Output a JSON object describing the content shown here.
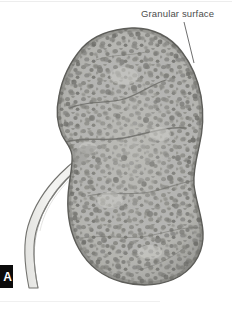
{
  "figure": {
    "panel_marker": "A",
    "background_color": "#ffffff"
  },
  "annotations": [
    {
      "id": "granular-surface",
      "label": "Granular surface",
      "text_x": 141,
      "text_y": 8,
      "leader_from": [
        184,
        22
      ],
      "leader_to": [
        194,
        63
      ],
      "leader_color": "#6e6e6e"
    }
  ],
  "anatomy": {
    "kidney": {
      "name": "kidney",
      "fill_color": "#b4b4b0",
      "outline_color": "#6a6a66",
      "speckle_colors": [
        "#8d8d89",
        "#7a7a76",
        "#6d6d69",
        "#a0a09c"
      ],
      "bounds": {
        "x": 58,
        "y": 27,
        "width": 148,
        "height": 258
      },
      "surface_texture": "granular"
    },
    "ureter": {
      "name": "ureter",
      "fill_color": "#f1f1ef",
      "outline_color": "#72726e",
      "bounds": {
        "x": 20,
        "y": 140,
        "width": 85,
        "height": 150
      }
    },
    "hilum": {
      "name": "renal-hilum",
      "position": [
        72,
        150
      ]
    }
  },
  "colors": {
    "ink": "#4c4c4c",
    "marker_bg": "#0b0b0b",
    "marker_fg": "#ffffff",
    "rule": "#ededed"
  }
}
